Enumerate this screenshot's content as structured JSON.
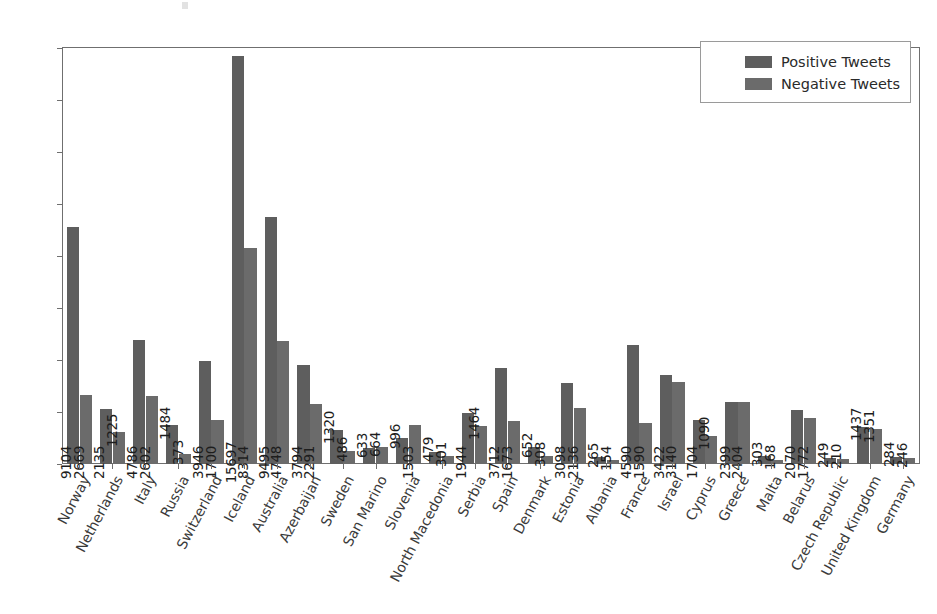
{
  "chart_data": {
    "type": "bar",
    "title": "",
    "xlabel": "",
    "ylabel": "",
    "ylim": [
      0,
      16000
    ],
    "ytick_values": [
      0,
      2000,
      4000,
      6000,
      8000,
      10000,
      12000,
      14000,
      16000
    ],
    "ytick_labels": [
      "0",
      "2000",
      "4000",
      "6000",
      "8000",
      "10000",
      "12000",
      "14000",
      "16000"
    ],
    "grid": false,
    "legend_position": "upper right",
    "categories": [
      "Norway",
      "Netherlands",
      "Italy",
      "Russia",
      "Switzerland",
      "Iceland",
      "Australia",
      "Azerbaijan",
      "Sweden",
      "San Marino",
      "Slovenia",
      "North Macedonia",
      "Serbia",
      "Spain",
      "Denmark",
      "Estonia",
      "Albania",
      "France",
      "Israel",
      "Cyprus",
      "Greece",
      "Malta",
      "Belarus",
      "Czech Republic",
      "United Kingdom",
      "Germany"
    ],
    "series": [
      {
        "name": "Positive Tweets",
        "color": "#5e5e5e",
        "values": [
          9104,
          2135,
          4786,
          1484,
          3946,
          15697,
          9495,
          3794,
          1320,
          633,
          996,
          479,
          1944,
          3712,
          652,
          3098,
          265,
          4590,
          3422,
          1704,
          2399,
          303,
          2070,
          249,
          1437,
          284
        ]
      },
      {
        "name": "Negative Tweets",
        "color": "#6b6b6b",
        "values": [
          2669,
          1225,
          2602,
          373,
          1700,
          8314,
          4748,
          2291,
          486,
          664,
          1503,
          301,
          1464,
          1673,
          308,
          2136,
          154,
          1590,
          3140,
          1090,
          2404,
          168,
          1772,
          210,
          1351,
          246
        ]
      }
    ]
  },
  "legend": {
    "items": [
      {
        "label": "Positive Tweets"
      },
      {
        "label": "Negative Tweets"
      }
    ]
  }
}
